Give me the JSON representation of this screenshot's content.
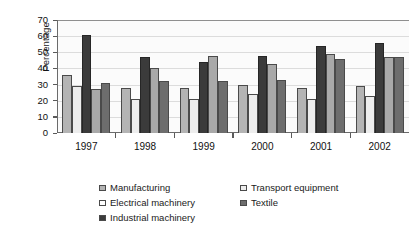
{
  "chart_data": {
    "type": "bar",
    "title": "",
    "xlabel": "",
    "ylabel": "Percentage",
    "categories": [
      "1997",
      "1998",
      "1999",
      "2000",
      "2001",
      "2002"
    ],
    "ylim": [
      0,
      70
    ],
    "yticks": [
      0,
      10,
      20,
      30,
      40,
      50,
      60,
      70
    ],
    "grid": true,
    "legend_position": "bottom",
    "series": [
      {
        "name": "Manufacturing",
        "color": "#b4b4b4",
        "values": [
          36,
          28,
          28,
          30,
          28,
          29
        ]
      },
      {
        "name": "Transport equipment",
        "color": "#ededed",
        "values": [
          29,
          21,
          21,
          24,
          21,
          23
        ]
      },
      {
        "name": "Electrical machinery",
        "color": "#3b3b3b",
        "values": [
          61,
          47,
          44,
          48,
          54,
          56
        ]
      },
      {
        "name": "Textile",
        "color": "#a9a9a9",
        "values": [
          27,
          40,
          48,
          43,
          49,
          47
        ]
      },
      {
        "name": "Industrial machinery",
        "color": "#6d6d6d",
        "values": [
          31,
          32,
          32,
          33,
          46,
          47
        ]
      }
    ]
  },
  "axis": {
    "y_title": "Percentage",
    "y_tick_labels": [
      "70",
      "60",
      "50",
      "40",
      "30",
      "20",
      "10",
      "0"
    ],
    "x_tick_labels": [
      "1997",
      "1998",
      "1999",
      "2000",
      "2001",
      "2002"
    ]
  },
  "legend": {
    "items": [
      {
        "label": "Manufacturing",
        "color": "#b4b4b4"
      },
      {
        "label": "Transport equipment",
        "color": "#ededed"
      },
      {
        "label": "Electrical machinery",
        "color": "#ffffff"
      },
      {
        "label": "Textile",
        "color": "#6d6d6d"
      },
      {
        "label": "Industrial machinery",
        "color": "#3b3b3b"
      }
    ]
  }
}
